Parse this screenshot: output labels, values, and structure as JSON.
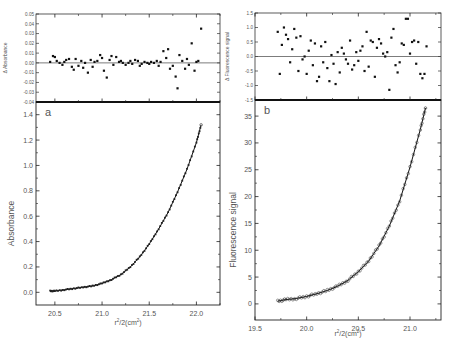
{
  "chart_data": [
    {
      "panel": "a",
      "type": "scatter",
      "subplots": [
        {
          "role": "residuals",
          "ylabel": "Δ Absorbance",
          "ylim": [
            -0.04,
            0.05
          ],
          "yticks": [
            "0.05",
            "0.04",
            "0.03",
            "0.02",
            "0.01",
            "0.00",
            "-0.01",
            "-0.02",
            "-0.03",
            "-0.04"
          ],
          "zero_line": true,
          "x": [
            20.45,
            20.48,
            20.5,
            20.52,
            20.55,
            20.58,
            20.6,
            20.62,
            20.65,
            20.68,
            20.7,
            20.72,
            20.75,
            20.78,
            20.8,
            20.82,
            20.85,
            20.88,
            20.9,
            20.92,
            20.95,
            20.98,
            21.0,
            21.02,
            21.05,
            21.08,
            21.1,
            21.12,
            21.15,
            21.18,
            21.2,
            21.22,
            21.25,
            21.28,
            21.3,
            21.32,
            21.35,
            21.38,
            21.4,
            21.42,
            21.45,
            21.48,
            21.5,
            21.52,
            21.55,
            21.58,
            21.6,
            21.62,
            21.65,
            21.68,
            21.7,
            21.72,
            21.75,
            21.78,
            21.8,
            21.82,
            21.85,
            21.88,
            21.9,
            21.92,
            21.95,
            21.98,
            22.0,
            22.02,
            22.05
          ],
          "values": [
            0.001,
            0.007,
            0.006,
            0.002,
            0.0,
            -0.002,
            0.001,
            0.003,
            0.004,
            -0.004,
            -0.007,
            0.004,
            -0.003,
            0.002,
            -0.005,
            0.0,
            -0.01,
            0.003,
            -0.004,
            0.001,
            0.002,
            0.008,
            0.005,
            -0.008,
            -0.015,
            0.003,
            0.007,
            -0.002,
            0.006,
            0.001,
            0.002,
            0.0,
            -0.002,
            0.0,
            0.002,
            -0.001,
            0.003,
            0.002,
            -0.003,
            -0.001,
            0.001,
            0.0,
            -0.001,
            0.001,
            0.0,
            0.002,
            -0.003,
            0.001,
            0.012,
            0.005,
            0.014,
            -0.006,
            -0.003,
            -0.014,
            -0.026,
            0.008,
            0.002,
            -0.006,
            0.004,
            -0.002,
            0.02,
            -0.008,
            0.001,
            0.002,
            0.035
          ]
        },
        {
          "role": "fit",
          "xlabel": "r²/2(cm²)",
          "ylabel": "Absorbance",
          "xlim": [
            20.3,
            22.25
          ],
          "ylim": [
            -0.1,
            1.5
          ],
          "xticks": [
            "20.5",
            "21.0",
            "21.5",
            "22.0"
          ],
          "yticks": [
            "0.0",
            "0.2",
            "0.4",
            "0.6",
            "0.8",
            "1.0",
            "1.2",
            "1.4"
          ],
          "x": [
            20.45,
            20.5,
            20.6,
            20.7,
            20.8,
            20.9,
            21.0,
            21.1,
            21.2,
            21.3,
            21.4,
            21.5,
            21.6,
            21.7,
            21.8,
            21.9,
            22.0,
            22.05
          ],
          "values": [
            0.01,
            0.01,
            0.02,
            0.03,
            0.04,
            0.05,
            0.07,
            0.1,
            0.14,
            0.2,
            0.28,
            0.38,
            0.5,
            0.63,
            0.79,
            0.97,
            1.18,
            1.32
          ]
        }
      ]
    },
    {
      "panel": "b",
      "type": "scatter",
      "subplots": [
        {
          "role": "residuals",
          "ylabel": "Δ Fluorescence signal",
          "ylim": [
            -1.5,
            1.5
          ],
          "yticks": [
            "1.5",
            "1.0",
            "0.5",
            "0.0",
            "-0.5",
            "-1.0",
            "-1.5"
          ],
          "zero_line": true,
          "x": [
            19.72,
            19.74,
            19.76,
            19.78,
            19.8,
            19.82,
            19.84,
            19.86,
            19.88,
            19.9,
            19.92,
            19.94,
            19.96,
            19.98,
            20.0,
            20.02,
            20.04,
            20.06,
            20.08,
            20.1,
            20.12,
            20.14,
            20.16,
            20.18,
            20.2,
            20.22,
            20.24,
            20.26,
            20.28,
            20.3,
            20.32,
            20.34,
            20.36,
            20.38,
            20.4,
            20.42,
            20.44,
            20.46,
            20.48,
            20.5,
            20.52,
            20.54,
            20.56,
            20.58,
            20.6,
            20.62,
            20.64,
            20.66,
            20.68,
            20.7,
            20.72,
            20.74,
            20.76,
            20.78,
            20.8,
            20.82,
            20.84,
            20.86,
            20.88,
            20.9,
            20.92,
            20.94,
            20.96,
            20.98,
            21.0,
            21.02,
            21.04,
            21.06,
            21.08,
            21.1,
            21.12,
            21.14,
            21.16
          ],
          "values": [
            0.85,
            -0.6,
            0.4,
            1.0,
            0.75,
            0.6,
            -0.2,
            0.25,
            0.95,
            0.65,
            -0.5,
            0.7,
            -0.1,
            0.0,
            -0.6,
            0.2,
            0.55,
            -0.3,
            0.45,
            -0.85,
            -0.7,
            0.35,
            -0.2,
            0.5,
            -0.4,
            -0.85,
            0.05,
            -0.25,
            -0.95,
            0.15,
            -0.55,
            0.3,
            0.1,
            -0.1,
            -0.25,
            0.55,
            -0.45,
            -0.3,
            0.15,
            -0.15,
            0.2,
            0.35,
            -0.5,
            0.85,
            -0.35,
            0.55,
            0.5,
            -0.7,
            0.3,
            0.6,
            0.45,
            0.1,
            0.0,
            0.15,
            -1.15,
            0.65,
            0.95,
            -0.3,
            -0.55,
            -0.2,
            0.45,
            0.4,
            1.3,
            1.3,
            0.1,
            0.5,
            0.55,
            -0.25,
            0.5,
            -0.6,
            -0.75,
            -0.6,
            0.35
          ]
        },
        {
          "role": "fit",
          "xlabel": "r²/2(cm²)",
          "ylabel": "Fluorescence signal",
          "xlim": [
            19.5,
            21.3
          ],
          "ylim": [
            -3,
            38
          ],
          "xticks": [
            "19.5",
            "20.0",
            "20.5",
            "21.0"
          ],
          "yticks": [
            "0",
            "5",
            "10",
            "15",
            "20",
            "25",
            "30",
            "35"
          ],
          "x": [
            19.72,
            19.8,
            19.9,
            20.0,
            20.1,
            20.2,
            20.3,
            20.4,
            20.5,
            20.6,
            20.7,
            20.8,
            20.9,
            21.0,
            21.1,
            21.15
          ],
          "values": [
            0.5,
            0.8,
            1.0,
            1.4,
            1.9,
            2.5,
            3.3,
            4.4,
            6.0,
            8.0,
            10.8,
            14.5,
            19.2,
            25.5,
            32.5,
            36.5
          ]
        }
      ]
    }
  ],
  "labels": {
    "panel_a": "a",
    "panel_b": "b",
    "a_res_ylabel": "Δ Absorbance",
    "a_ylabel": "Absorbance",
    "a_xlabel_base": "r",
    "a_xlabel_mid": "/2(cm",
    "a_xlabel_end": ")",
    "b_res_ylabel": "Δ Fluorescence signal",
    "b_ylabel": "Fluorescence signal",
    "sup": "2"
  }
}
